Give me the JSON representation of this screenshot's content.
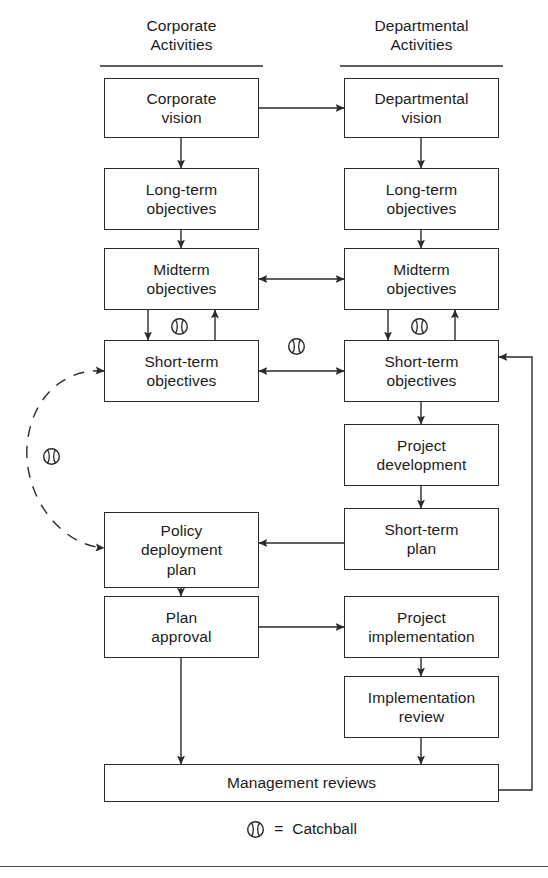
{
  "figure": {
    "stroke_color": "#2a2a2a",
    "text_color": "#1b1b1b",
    "background": "#ffffff"
  },
  "columns": [
    {
      "id": "corporate",
      "header_line1": "Corporate",
      "header_line2": "Activities"
    },
    {
      "id": "departmental",
      "header_line1": "Departmental",
      "header_line2": "Activities"
    }
  ],
  "nodes": [
    {
      "id": "corporate-vision",
      "label": "Corporate\nvision",
      "column": "corporate",
      "x": 104,
      "y": 78,
      "w": 155,
      "h": 60
    },
    {
      "id": "departmental-vision",
      "label": "Departmental\nvision",
      "column": "departmental",
      "x": 344,
      "y": 78,
      "w": 155,
      "h": 60
    },
    {
      "id": "corp-long-term",
      "label": "Long-term\nobjectives",
      "column": "corporate",
      "x": 104,
      "y": 168,
      "w": 155,
      "h": 62
    },
    {
      "id": "dept-long-term",
      "label": "Long-term\nobjectives",
      "column": "departmental",
      "x": 344,
      "y": 168,
      "w": 155,
      "h": 62
    },
    {
      "id": "corp-midterm",
      "label": "Midterm\nobjectives",
      "column": "corporate",
      "x": 104,
      "y": 248,
      "w": 155,
      "h": 62
    },
    {
      "id": "dept-midterm",
      "label": "Midterm\nobjectives",
      "column": "departmental",
      "x": 344,
      "y": 248,
      "w": 155,
      "h": 62
    },
    {
      "id": "corp-short-term",
      "label": "Short-term\nobjectives",
      "column": "corporate",
      "x": 104,
      "y": 340,
      "w": 155,
      "h": 62
    },
    {
      "id": "dept-short-term",
      "label": "Short-term\nobjectives",
      "column": "departmental",
      "x": 344,
      "y": 340,
      "w": 155,
      "h": 62
    },
    {
      "id": "project-development",
      "label": "Project\ndevelopment",
      "column": "departmental",
      "x": 344,
      "y": 424,
      "w": 155,
      "h": 62
    },
    {
      "id": "short-term-plan",
      "label": "Short-term\nplan",
      "column": "departmental",
      "x": 344,
      "y": 508,
      "w": 155,
      "h": 62
    },
    {
      "id": "policy-deployment-plan",
      "label": "Policy\ndeployment\nplan",
      "column": "corporate",
      "x": 104,
      "y": 512,
      "w": 155,
      "h": 76
    },
    {
      "id": "plan-approval",
      "label": "Plan\napproval",
      "column": "corporate",
      "x": 104,
      "y": 596,
      "w": 155,
      "h": 62
    },
    {
      "id": "project-implementation",
      "label": "Project\nimplementation",
      "column": "departmental",
      "x": 344,
      "y": 596,
      "w": 155,
      "h": 62
    },
    {
      "id": "implementation-review",
      "label": "Implementation\nreview",
      "column": "departmental",
      "x": 344,
      "y": 676,
      "w": 155,
      "h": 62
    },
    {
      "id": "management-reviews",
      "label": "Management reviews",
      "column": "both",
      "x": 104,
      "y": 764,
      "w": 395,
      "h": 38
    }
  ],
  "catchball_markers": [
    {
      "id": "catchball-corp-midterm-shortterm",
      "x": 170,
      "y": 317
    },
    {
      "id": "catchball-dept-midterm-shortterm",
      "x": 410,
      "y": 317
    },
    {
      "id": "catchball-shortterm-crosslink",
      "x": 287,
      "y": 355
    },
    {
      "id": "catchball-dashed-loop",
      "x": 42,
      "y": 447
    }
  ],
  "edges": [
    {
      "id": "corporate-vision-to-departmental-vision",
      "style": "solid",
      "arrows": "end"
    },
    {
      "id": "corporate-vision-to-long-term",
      "style": "solid",
      "arrows": "end"
    },
    {
      "id": "departmental-vision-to-long-term",
      "style": "solid",
      "arrows": "end"
    },
    {
      "id": "corp-long-term-to-midterm",
      "style": "solid",
      "arrows": "end"
    },
    {
      "id": "dept-long-term-to-midterm",
      "style": "solid",
      "arrows": "end"
    },
    {
      "id": "midterm-to-midterm",
      "style": "solid",
      "arrows": "both"
    },
    {
      "id": "corp-midterm-to-short-term",
      "style": "solid",
      "arrows": "end"
    },
    {
      "id": "corp-short-term-to-midterm",
      "style": "solid",
      "arrows": "end"
    },
    {
      "id": "dept-midterm-to-short-term",
      "style": "solid",
      "arrows": "end"
    },
    {
      "id": "dept-short-term-to-midterm",
      "style": "solid",
      "arrows": "end"
    },
    {
      "id": "short-term-to-short-term",
      "style": "solid",
      "arrows": "both"
    },
    {
      "id": "dept-short-term-to-project-development",
      "style": "solid",
      "arrows": "end"
    },
    {
      "id": "project-development-to-short-term-plan",
      "style": "solid",
      "arrows": "end"
    },
    {
      "id": "short-term-plan-to-policy-plan",
      "style": "solid",
      "arrows": "end"
    },
    {
      "id": "policy-plan-to-plan-approval",
      "style": "solid",
      "arrows": "end"
    },
    {
      "id": "plan-approval-to-project-implementation",
      "style": "solid",
      "arrows": "end"
    },
    {
      "id": "project-implementation-to-review",
      "style": "solid",
      "arrows": "end"
    },
    {
      "id": "plan-approval-to-management-reviews",
      "style": "solid",
      "arrows": "end"
    },
    {
      "id": "implementation-review-to-management",
      "style": "solid",
      "arrows": "end"
    },
    {
      "id": "management-reviews-feedback-loop",
      "style": "solid",
      "arrows": "end"
    },
    {
      "id": "dashed-catchball-loop",
      "style": "dashed",
      "arrows": "both"
    }
  ],
  "legend": {
    "symbol_name": "catchball-icon",
    "equals": "=",
    "label": "Catchball"
  }
}
